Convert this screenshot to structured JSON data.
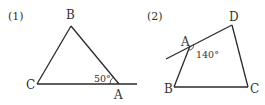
{
  "figures": [
    {
      "number": "(1)",
      "type": "triangle",
      "vertices": {
        "B": "B",
        "C": "C",
        "A": "A"
      },
      "angle_label": "50°",
      "description": "Triangle ABC with side CA extended past A; exterior angle at A marked 50°"
    },
    {
      "number": "(2)",
      "type": "quadrilateral",
      "vertices": {
        "A": "A",
        "B": "B",
        "C": "C",
        "D": "D"
      },
      "angle_label": "140°",
      "description": "Quadrilateral ABCD with side DA extended past A; angle at A marked 140°"
    }
  ],
  "colors": {
    "stroke": "#2a2a2a",
    "text": "#333333"
  }
}
